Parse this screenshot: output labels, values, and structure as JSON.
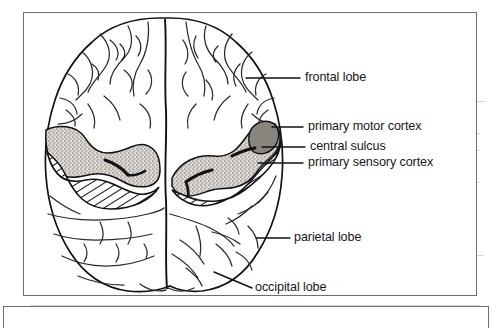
{
  "figure": {
    "kind": "anatomical-diagram",
    "labels": [
      {
        "id": "frontal-lobe",
        "text": "frontal lobe"
      },
      {
        "id": "primary-motor-cortex",
        "text": "primary motor cortex"
      },
      {
        "id": "central-sulcus",
        "text": "central sulcus"
      },
      {
        "id": "primary-sensory-cortex",
        "text": "primary sensory cortex"
      },
      {
        "id": "parietal-lobe",
        "text": "parietal lobe"
      },
      {
        "id": "occipital-lobe",
        "text": "occipital lobe"
      }
    ],
    "colors": {
      "ink": "#121214",
      "frame": "#6e6e72",
      "page": "#ffffff",
      "stipple_fill": "#b4b0ab",
      "hatch_stroke": "#121214",
      "scanline": "#cfcfd4"
    },
    "regions": {
      "stippled": "primary motor cortex / precentral gyrus band (gray stipple)",
      "hatched": "primary sensory cortex / postcentral gyrus band (diagonal hatch)",
      "central_sulcus": "dark groove between stippled and hatched bands"
    }
  }
}
